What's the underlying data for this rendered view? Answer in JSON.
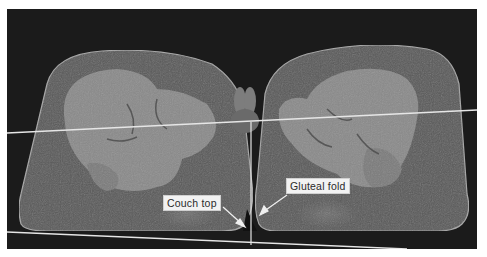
{
  "figure": {
    "annotations": [
      {
        "id": "couch-top",
        "text": "Couch top"
      },
      {
        "id": "gluteal-fold",
        "text": "Gluteal fold"
      }
    ],
    "colors": {
      "background": "#1b1b1b",
      "soft_tissue": "#5e5e5e",
      "muscle": "#8a8a8a",
      "skin_outline": "#a8a8a8",
      "lines": "#e6e6e6",
      "label_bg": "#f2f2f2"
    }
  }
}
